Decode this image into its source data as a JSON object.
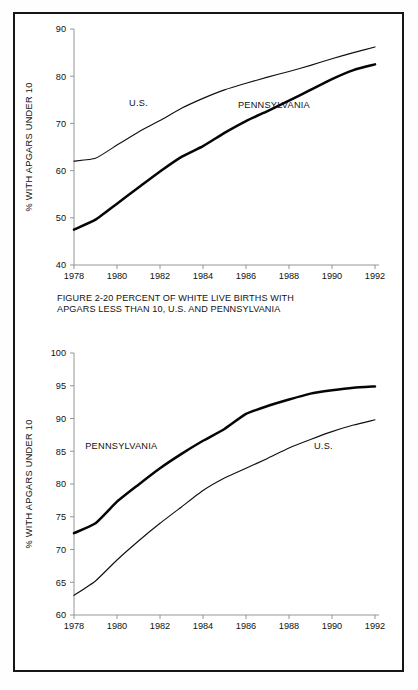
{
  "document": {
    "kind": "two-panel-line-chart-figure",
    "background_color": "#ffffff",
    "frame_color": "#161616"
  },
  "chart_data": [
    {
      "id": "figure-2-20",
      "type": "line",
      "title": "FIGURE 2-20  PERCENT OF WHITE LIVE BIRTHS WITH\nAPGARS LESS THAN 10, U.S. AND PENNSYLVANIA",
      "caption_line1": "FIGURE 2-20  PERCENT OF WHITE LIVE BIRTHS WITH",
      "caption_line2": "APGARS LESS THAN 10, U.S. AND PENNSYLVANIA",
      "xlabel": "",
      "ylabel": "% WITH APGARS UNDER 10",
      "x": [
        1978,
        1979,
        1980,
        1981,
        1982,
        1983,
        1984,
        1985,
        1986,
        1987,
        1988,
        1989,
        1990,
        1991,
        1992
      ],
      "xticks": [
        "1978",
        "1980",
        "1982",
        "1984",
        "1986",
        "1988",
        "1990",
        "1992"
      ],
      "xtick_values": [
        1978,
        1980,
        1982,
        1984,
        1986,
        1988,
        1990,
        1992
      ],
      "xlim": [
        1978,
        1992
      ],
      "yticks": [
        "40",
        "50",
        "60",
        "70",
        "80",
        "90"
      ],
      "ytick_values": [
        40,
        50,
        60,
        70,
        80,
        90
      ],
      "ylim": [
        40,
        90
      ],
      "grid": false,
      "legend_position": "inline-annotation",
      "series": [
        {
          "name": "U.S.",
          "label": "U.S.",
          "style": "thin",
          "label_x": 1981.0,
          "label_y": 73.6,
          "values": [
            62.0,
            62.6,
            65.4,
            68.2,
            70.6,
            73.2,
            75.3,
            77.1,
            78.5,
            79.8,
            81.0,
            82.3,
            83.7,
            85.0,
            86.2
          ]
        },
        {
          "name": "PENNSYLVANIA",
          "label": "PENNSYLVANIA",
          "style": "thick",
          "label_x": 1987.3,
          "label_y": 73.2,
          "values": [
            47.5,
            49.6,
            53.0,
            56.4,
            59.8,
            62.9,
            65.2,
            68.0,
            70.5,
            72.6,
            74.8,
            77.1,
            79.4,
            81.3,
            82.5
          ]
        }
      ]
    },
    {
      "id": "figure-2-21",
      "type": "line",
      "title": "FIGURE 2-21  PERCENT OF BLACK LIVE BIRTHS WITH\nAPGARS LESS THAN 10, U.S. AND PENNSYLVANIA",
      "caption_line1": "FIGURE 2-21  PERCENT OF BLACK LIVE BIRTHS WITH",
      "caption_line2": "APGARS LESS THAN 10, U.S. AND PENNSYLVANIA",
      "xlabel": "",
      "ylabel": "% WITH APGARS UNDER 10",
      "x": [
        1978,
        1979,
        1980,
        1981,
        1982,
        1983,
        1984,
        1985,
        1986,
        1987,
        1988,
        1989,
        1990,
        1991,
        1992
      ],
      "xticks": [
        "1978",
        "1980",
        "1982",
        "1984",
        "1986",
        "1988",
        "1990",
        "1992"
      ],
      "xtick_values": [
        1978,
        1980,
        1982,
        1984,
        1986,
        1988,
        1990,
        1992
      ],
      "xlim": [
        1978,
        1992
      ],
      "yticks": [
        "60",
        "65",
        "70",
        "75",
        "80",
        "85",
        "90",
        "95",
        "100"
      ],
      "ytick_values": [
        60,
        65,
        70,
        75,
        80,
        85,
        90,
        95,
        100
      ],
      "ylim": [
        60,
        100
      ],
      "grid": false,
      "legend_position": "inline-annotation",
      "series": [
        {
          "name": "PENNSYLVANIA",
          "label": "PENNSYLVANIA",
          "style": "thick",
          "label_x": 1980.2,
          "label_y": 85.4,
          "values": [
            72.5,
            74.0,
            77.3,
            79.9,
            82.4,
            84.6,
            86.6,
            88.4,
            90.7,
            91.9,
            92.9,
            93.8,
            94.3,
            94.7,
            94.9
          ]
        },
        {
          "name": "U.S.",
          "label": "U.S.",
          "style": "thin",
          "label_x": 1989.6,
          "label_y": 85.4,
          "values": [
            63.0,
            65.2,
            68.4,
            71.3,
            74.0,
            76.5,
            79.0,
            80.9,
            82.4,
            83.9,
            85.5,
            86.8,
            88.0,
            89.0,
            89.8
          ]
        }
      ]
    }
  ]
}
